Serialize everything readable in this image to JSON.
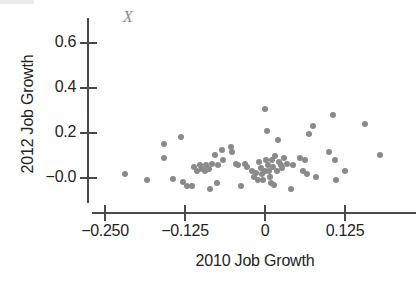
{
  "chart_data": {
    "type": "scatter",
    "title": "",
    "annotation": "X",
    "xlabel": "2010 Job Growth",
    "ylabel": "2012 Job Growth",
    "xticks": [
      -0.25,
      -0.125,
      0,
      0.125
    ],
    "xtick_labels": [
      "−0.250",
      "−0.125",
      "0",
      "0.125"
    ],
    "yticks": [
      0.6,
      0.4,
      0.2,
      -0.0
    ],
    "ytick_labels": [
      "0.6",
      "0.4",
      "0.2",
      "−0.0"
    ],
    "xlim": [
      -0.2875,
      0.2
    ],
    "ylim": [
      -0.085,
      0.685
    ],
    "grid": false,
    "legend": null,
    "marker_color": "#8a8a8a",
    "axis_color": "#4a4a4a",
    "points": [
      {
        "x": -0.2188,
        "y": 0.0156
      },
      {
        "x": -0.1844,
        "y": -0.0067
      },
      {
        "x": -0.1578,
        "y": 0.1511
      },
      {
        "x": -0.1578,
        "y": 0.0889
      },
      {
        "x": -0.1438,
        "y": -0.0044
      },
      {
        "x": -0.1313,
        "y": 0.1822
      },
      {
        "x": -0.1281,
        "y": -0.0156
      },
      {
        "x": -0.1219,
        "y": -0.0356
      },
      {
        "x": -0.1141,
        "y": -0.0356
      },
      {
        "x": -0.1109,
        "y": 0.0467
      },
      {
        "x": -0.1063,
        "y": 0.0333
      },
      {
        "x": -0.1016,
        "y": 0.0556
      },
      {
        "x": -0.0984,
        "y": 0.0422
      },
      {
        "x": -0.0938,
        "y": 0.0289
      },
      {
        "x": -0.0922,
        "y": 0.0556
      },
      {
        "x": -0.0875,
        "y": 0.0422
      },
      {
        "x": -0.0859,
        "y": -0.0489
      },
      {
        "x": -0.0828,
        "y": 0.0644
      },
      {
        "x": -0.0781,
        "y": 0.1022
      },
      {
        "x": -0.075,
        "y": -0.0222
      },
      {
        "x": -0.0734,
        "y": 0.06
      },
      {
        "x": -0.0672,
        "y": 0.1244
      },
      {
        "x": -0.0656,
        "y": 0.0822
      },
      {
        "x": -0.0531,
        "y": 0.1378
      },
      {
        "x": -0.0516,
        "y": 0.1156
      },
      {
        "x": -0.0453,
        "y": 0.0644
      },
      {
        "x": -0.0422,
        "y": 0.0556
      },
      {
        "x": -0.0375,
        "y": -0.0356
      },
      {
        "x": -0.0313,
        "y": 0.0644
      },
      {
        "x": -0.0281,
        "y": 0.0489
      },
      {
        "x": -0.0203,
        "y": 0.0333
      },
      {
        "x": -0.0172,
        "y": 0.0044
      },
      {
        "x": -0.0141,
        "y": 0.0222
      },
      {
        "x": -0.0109,
        "y": -0.0067
      },
      {
        "x": -0.0094,
        "y": 0.0689
      },
      {
        "x": -0.0063,
        "y": 0.0444
      },
      {
        "x": -0.0047,
        "y": 0.0178
      },
      {
        "x": -0.0031,
        "y": -0.0067
      },
      {
        "x": 0.0,
        "y": 0.3067
      },
      {
        "x": 0.0,
        "y": 0.0333
      },
      {
        "x": 0.0016,
        "y": 0.0822
      },
      {
        "x": 0.0031,
        "y": 0.2089
      },
      {
        "x": 0.0047,
        "y": 0.06
      },
      {
        "x": 0.0063,
        "y": 0.0333
      },
      {
        "x": 0.0078,
        "y": 0.0044
      },
      {
        "x": 0.0094,
        "y": -0.02
      },
      {
        "x": 0.0109,
        "y": 0.0822
      },
      {
        "x": 0.0125,
        "y": 0.0467
      },
      {
        "x": 0.0141,
        "y": -0.0289
      },
      {
        "x": 0.0156,
        "y": 0.0978
      },
      {
        "x": 0.0188,
        "y": 0.0333
      },
      {
        "x": 0.0203,
        "y": 0.1689
      },
      {
        "x": 0.0219,
        "y": 0.0689
      },
      {
        "x": 0.025,
        "y": 0.0556
      },
      {
        "x": 0.0266,
        "y": 0.0444
      },
      {
        "x": 0.0297,
        "y": 0.0911
      },
      {
        "x": 0.0344,
        "y": 0.0644
      },
      {
        "x": 0.0406,
        "y": -0.0467
      },
      {
        "x": 0.0438,
        "y": 0.0578
      },
      {
        "x": 0.0547,
        "y": 0.0911
      },
      {
        "x": 0.0594,
        "y": 0.0333
      },
      {
        "x": 0.0625,
        "y": 0.0822
      },
      {
        "x": 0.0656,
        "y": 0.0178
      },
      {
        "x": 0.0688,
        "y": 0.1956
      },
      {
        "x": 0.075,
        "y": 0.2289
      },
      {
        "x": 0.0797,
        "y": 0.0044
      },
      {
        "x": 0.1,
        "y": 0.1156
      },
      {
        "x": 0.1063,
        "y": 0.2822
      },
      {
        "x": 0.1094,
        "y": 0.0778
      },
      {
        "x": 0.1109,
        "y": -0.0067
      },
      {
        "x": 0.125,
        "y": 0.0289
      },
      {
        "x": 0.1563,
        "y": 0.24
      },
      {
        "x": 0.1797,
        "y": 0.1022
      }
    ]
  }
}
